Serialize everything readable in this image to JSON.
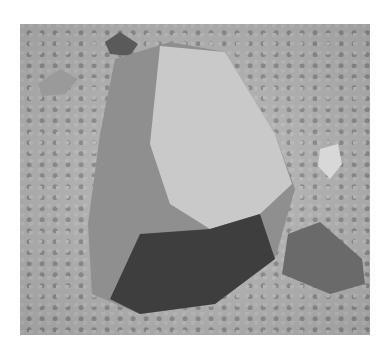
{
  "image": {
    "subject": "wind-faceted rock (ventifact) resting on gravel ground",
    "style": "grayscale photograph",
    "colors": {
      "background": "#ffffff",
      "gravel": "#b4b4b4",
      "rock_light": "#c9c9c9",
      "rock_mid": "#8f8f8f",
      "rock_dark": "#3e3e3e"
    }
  }
}
